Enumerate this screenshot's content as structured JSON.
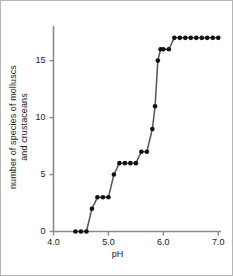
{
  "chart_data": {
    "type": "line",
    "title": "",
    "xlabel": "pH",
    "ylabel": "number of species of molluscs and crustaceans",
    "ylabel_lines": [
      "number of species of molluscs",
      "and crustaceans"
    ],
    "xlim": [
      4.0,
      7.05
    ],
    "ylim": [
      0,
      17.6
    ],
    "xticks": [
      4.0,
      5.0,
      6.0,
      7.0
    ],
    "xtick_labels": [
      "4.0",
      "5.0",
      "6.0",
      "7.0"
    ],
    "yticks": [
      0,
      5,
      10,
      15
    ],
    "ytick_labels": [
      "0",
      "5",
      "10",
      "15"
    ],
    "grid": false,
    "legend": null,
    "marker": "filled-circle",
    "marker_color": "#111111",
    "line_color": "#555555",
    "x": [
      4.4,
      4.5,
      4.6,
      4.7,
      4.8,
      4.9,
      5.0,
      5.1,
      5.2,
      5.3,
      5.4,
      5.5,
      5.6,
      5.7,
      5.8,
      5.85,
      5.9,
      5.95,
      6.0,
      6.1,
      6.2,
      6.3,
      6.4,
      6.5,
      6.6,
      6.7,
      6.8,
      6.9,
      7.0
    ],
    "y": [
      0,
      0,
      0,
      2,
      3,
      3,
      3,
      5,
      6,
      6,
      6,
      6,
      7,
      7,
      9,
      11,
      15,
      16,
      16,
      16,
      17,
      17,
      17,
      17,
      17,
      17,
      17,
      17,
      17
    ],
    "points": [
      {
        "x": 4.4,
        "y": 0
      },
      {
        "x": 4.5,
        "y": 0
      },
      {
        "x": 4.6,
        "y": 0
      },
      {
        "x": 4.7,
        "y": 2
      },
      {
        "x": 4.8,
        "y": 3
      },
      {
        "x": 4.9,
        "y": 3
      },
      {
        "x": 5.0,
        "y": 3
      },
      {
        "x": 5.1,
        "y": 5
      },
      {
        "x": 5.2,
        "y": 6
      },
      {
        "x": 5.3,
        "y": 6
      },
      {
        "x": 5.4,
        "y": 6
      },
      {
        "x": 5.5,
        "y": 6
      },
      {
        "x": 5.6,
        "y": 7
      },
      {
        "x": 5.7,
        "y": 7
      },
      {
        "x": 5.8,
        "y": 9
      },
      {
        "x": 5.85,
        "y": 11
      },
      {
        "x": 5.9,
        "y": 15
      },
      {
        "x": 5.95,
        "y": 16
      },
      {
        "x": 6.0,
        "y": 16
      },
      {
        "x": 6.1,
        "y": 16
      },
      {
        "x": 6.2,
        "y": 17
      },
      {
        "x": 6.3,
        "y": 17
      },
      {
        "x": 6.4,
        "y": 17
      },
      {
        "x": 6.5,
        "y": 17
      },
      {
        "x": 6.6,
        "y": 17
      },
      {
        "x": 6.7,
        "y": 17
      },
      {
        "x": 6.8,
        "y": 17
      },
      {
        "x": 6.9,
        "y": 17
      },
      {
        "x": 7.0,
        "y": 17
      }
    ]
  },
  "colors": {
    "frame": "#b5b5b5",
    "axis": "#8a8a8a",
    "text": "#1a1a1a",
    "marker": "#111111",
    "line": "#555555",
    "background": "#ffffff"
  }
}
